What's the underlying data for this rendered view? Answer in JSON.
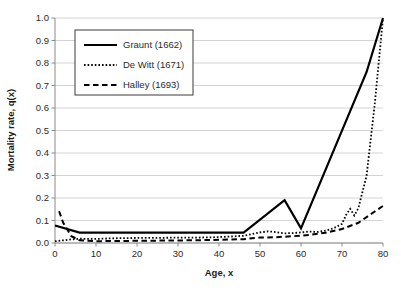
{
  "chart_data": {
    "type": "line",
    "title": "",
    "xlabel": "Age, x",
    "ylabel": "Mortality rate, q(x)",
    "xlim": [
      0,
      80
    ],
    "ylim": [
      0.0,
      1.0
    ],
    "xticks": [
      0,
      10,
      20,
      30,
      40,
      50,
      60,
      70,
      80
    ],
    "xtick_labels": [
      "0",
      "10",
      "20",
      "30",
      "40",
      "50",
      "60",
      "70",
      "80"
    ],
    "yticks": [
      0.0,
      0.1,
      0.2,
      0.3,
      0.4,
      0.5,
      0.6,
      0.7,
      0.8,
      0.9,
      1.0
    ],
    "ytick_labels": [
      "0.0",
      "0.1",
      "0.2",
      "0.3",
      "0.4",
      "0.5",
      "0.6",
      "0.7",
      "0.8",
      "0.9",
      "1.0"
    ],
    "grid": "horizontal",
    "legend_position": "upper-left",
    "colors": {
      "series": "#000000",
      "gridline": "#c9c9c9",
      "axis": "#8a8a8a",
      "text": "#2b2b2b",
      "legend_border": "#3a3a3a",
      "background": "#ffffff"
    },
    "series": [
      {
        "name": "Graunt (1662)",
        "style": "solid",
        "dash": "",
        "width": 2.2,
        "x": [
          0,
          6,
          16,
          26,
          36,
          46,
          56,
          60,
          76,
          80
        ],
        "values": [
          0.078,
          0.046,
          0.046,
          0.046,
          0.046,
          0.046,
          0.19,
          0.065,
          0.76,
          1.0
        ]
      },
      {
        "name": "De Witt (1671)",
        "style": "dotted",
        "dash": "1.6,2.0",
        "width": 1.8,
        "x": [
          0,
          2,
          4,
          6,
          10,
          14,
          18,
          22,
          26,
          30,
          34,
          38,
          42,
          46,
          50,
          52,
          54,
          56,
          58,
          60,
          62,
          64,
          66,
          68,
          70,
          71,
          72,
          73,
          74,
          76,
          78,
          80
        ],
        "values": [
          0.008,
          0.012,
          0.016,
          0.019,
          0.018,
          0.021,
          0.022,
          0.023,
          0.023,
          0.024,
          0.024,
          0.025,
          0.028,
          0.032,
          0.047,
          0.052,
          0.048,
          0.043,
          0.044,
          0.047,
          0.051,
          0.049,
          0.055,
          0.066,
          0.085,
          0.125,
          0.152,
          0.122,
          0.155,
          0.3,
          0.62,
          1.0
        ]
      },
      {
        "name": "Halley (1693)",
        "style": "dashed",
        "dash": "5.5,3.5",
        "width": 2.0,
        "x": [
          1,
          2,
          4,
          6,
          10,
          16,
          22,
          28,
          34,
          40,
          46,
          50,
          54,
          58,
          62,
          66,
          70,
          74,
          78,
          80
        ],
        "values": [
          0.141,
          0.09,
          0.03,
          0.012,
          0.008,
          0.009,
          0.01,
          0.011,
          0.012,
          0.014,
          0.017,
          0.024,
          0.026,
          0.03,
          0.036,
          0.046,
          0.062,
          0.09,
          0.14,
          0.165
        ]
      }
    ]
  },
  "legend": {
    "entries": [
      {
        "label": "Graunt (1662)"
      },
      {
        "label": "De Witt (1671)"
      },
      {
        "label": "Halley (1693)"
      }
    ]
  }
}
